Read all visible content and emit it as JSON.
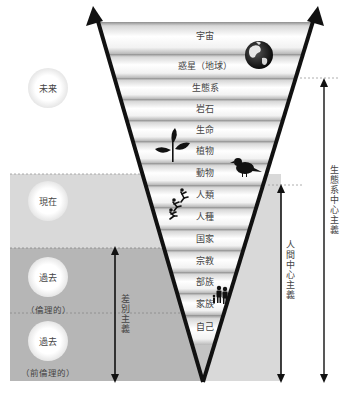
{
  "diagram": {
    "type": "inverted-funnel",
    "funnel_bands": [
      {
        "label": "宇宙",
        "y": 35
      },
      {
        "label": "惑星（地球）",
        "y": 65
      },
      {
        "label": "生態系",
        "y": 88
      },
      {
        "label": "岩石",
        "y": 109
      },
      {
        "label": "生命",
        "y": 130
      },
      {
        "label": "植物",
        "y": 151
      },
      {
        "label": "動物",
        "y": 173
      },
      {
        "label": "人類",
        "y": 195
      },
      {
        "label": "人種",
        "y": 217
      },
      {
        "label": "国家",
        "y": 239
      },
      {
        "label": "宗教",
        "y": 261
      },
      {
        "label": "部族",
        "y": 282
      },
      {
        "label": "家族",
        "y": 304
      },
      {
        "label": "自己",
        "y": 325
      }
    ],
    "eras": [
      {
        "label": "未来",
        "sub": ""
      },
      {
        "label": "現在",
        "sub": ""
      },
      {
        "label": "過去",
        "sub": "（倫理的）"
      },
      {
        "label": "過去",
        "sub": "（前倫理的）"
      }
    ],
    "ranges": [
      {
        "label": "差別主義"
      },
      {
        "label": "人間中心主義"
      },
      {
        "label": "生態系中心主義"
      }
    ],
    "icons": [
      "globe-icon",
      "plant-icon",
      "bird-icon",
      "climbing-people-icon",
      "family-icon"
    ],
    "colors": {
      "present_region": "#d9d9d9",
      "past_region": "#b5b5b5",
      "funnel_outline": "#111111",
      "band_light": "#ffffff",
      "band_dark": "#9a9a9a"
    }
  }
}
